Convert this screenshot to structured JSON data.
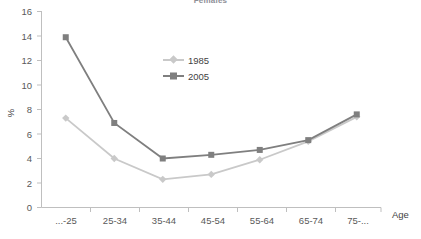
{
  "chart": {
    "title": "Females",
    "y_axis_title": "%",
    "x_axis_title": "Age"
  },
  "chart_data": {
    "type": "line",
    "title": "Females",
    "xlabel": "Age",
    "ylabel": "%",
    "categories": [
      "...-25",
      "25-34",
      "35-44",
      "45-54",
      "55-64",
      "65-74",
      "75-..."
    ],
    "series": [
      {
        "name": "1985",
        "color": "#c9c9c9",
        "marker": "diamond",
        "values": [
          7.3,
          4.0,
          2.3,
          2.7,
          3.9,
          5.4,
          7.4
        ]
      },
      {
        "name": "2005",
        "color": "#7f7f7f",
        "marker": "square",
        "values": [
          13.9,
          6.9,
          4.0,
          4.3,
          4.7,
          5.5,
          7.6
        ]
      }
    ],
    "ylim": [
      0,
      16
    ],
    "y_ticks": [
      0,
      2,
      4,
      6,
      8,
      10,
      12,
      14,
      16
    ],
    "grid": false,
    "legend_position": "inside-top-center"
  },
  "legend": {
    "items": [
      {
        "label": "1985"
      },
      {
        "label": "2005"
      }
    ]
  },
  "y_tick_labels": [
    "16",
    "14",
    "12",
    "10",
    "8",
    "6",
    "4",
    "2",
    "0"
  ],
  "x_tick_labels": [
    "...-25",
    "25-34",
    "35-44",
    "45-54",
    "55-64",
    "65-74",
    "75-..."
  ]
}
